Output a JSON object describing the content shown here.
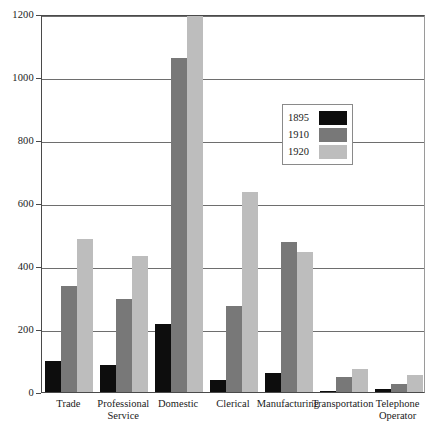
{
  "chart_data": {
    "type": "bar",
    "title": "",
    "xlabel": "",
    "ylabel": "",
    "ylim": [
      0,
      1200
    ],
    "yticks": [
      0,
      200,
      400,
      600,
      800,
      1000,
      1200
    ],
    "ytick_labels": [
      "0",
      "200",
      "400",
      "600",
      "800",
      "1000",
      "1200"
    ],
    "grid": true,
    "legend_position": "upper-right-inset",
    "categories": [
      "Trade",
      "Professional Service",
      "Domestic",
      "Clerical",
      "Manufacturing",
      "Transportation",
      "Telephone Operator"
    ],
    "series": [
      {
        "name": "1895",
        "color": "#0d0d0d",
        "values": [
          98,
          86,
          217,
          38,
          60,
          2,
          8
        ]
      },
      {
        "name": "1910",
        "color": "#787878",
        "values": [
          337,
          296,
          1060,
          273,
          476,
          48,
          26
        ]
      },
      {
        "name": "1920",
        "color": "#bdbdbd",
        "values": [
          486,
          433,
          1240,
          635,
          444,
          74,
          53
        ]
      }
    ]
  },
  "colors": {
    "series_1895": "#0d0d0d",
    "series_1910": "#787878",
    "series_1920": "#bdbdbd",
    "axis": "#4a4a4a",
    "grid": "#6e6e6e",
    "background": "#ffffff"
  }
}
